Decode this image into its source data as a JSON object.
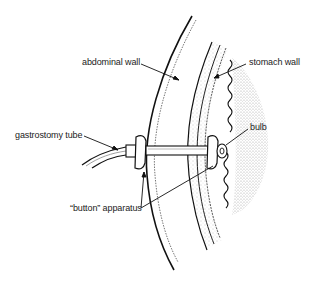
{
  "diagram": {
    "labels": {
      "abdominal_wall": "abdominal wall",
      "stomach_wall": "stomach wall",
      "gastrostomy_tube": "gastrostomy tube",
      "bulb": "bulb",
      "button_apparatus": "“button” apparatus"
    },
    "colors": {
      "background": "#ffffff",
      "ink": "#1a1a1a",
      "stipple": "#555555"
    }
  }
}
